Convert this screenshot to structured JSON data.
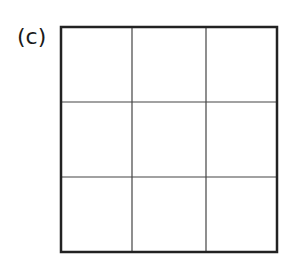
{
  "figure": {
    "label": "(c)",
    "grid": {
      "rows": 3,
      "cols": 3,
      "outer_border_color": "#222222",
      "inner_line_color": "#444444",
      "outer_box": {
        "left": 61,
        "top": 27,
        "right": 277,
        "bottom": 252
      },
      "vertical_lines_x": [
        132,
        206
      ],
      "horizontal_lines_y": [
        102,
        177
      ]
    }
  }
}
